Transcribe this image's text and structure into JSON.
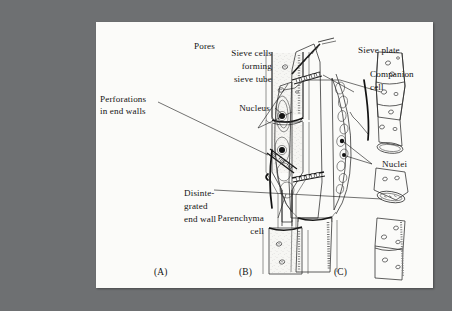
{
  "figure": {
    "background_color": "#6e7072",
    "plate_color": "#fbfbf9",
    "ink_color": "#121212"
  },
  "labels": {
    "pores": "Pores",
    "perforations": "Perforations\nin end walls",
    "perforations_line1": "Perforations",
    "perforations_line2": "in end walls",
    "disintegrated_line1": "Disinte-",
    "disintegrated_line2": "grated",
    "disintegrated_line3": "end wall",
    "sieve_cells_line1": "Sieve cells",
    "sieve_cells_line2": "forming",
    "sieve_cells_line3": "sieve tube",
    "sieve_plate": "Sieve plate",
    "companion_line1": "Companion",
    "companion_line2": "cell",
    "nucleus": "Nucleus",
    "nuclei": "Nuclei",
    "parenchyma_line1": "Parenchyma",
    "parenchyma_line2": "cell"
  },
  "captions": {
    "a": "(A)",
    "b": "(B)",
    "c": "(C)"
  },
  "panels": [
    {
      "id": "A",
      "caption": "(A)",
      "description": "Vessel element with perforated end walls",
      "annotations": [
        "Pores",
        "Perforations in end walls"
      ]
    },
    {
      "id": "B",
      "caption": "(B)",
      "description": "Separated vessel segments showing disintegrated end wall",
      "annotations": [
        "Pores",
        "Disintegrated end wall"
      ]
    },
    {
      "id": "C",
      "caption": "(C)",
      "description": "Sieve tube with sieve plates, companion cells and parenchyma",
      "annotations": [
        "Sieve cells forming sieve tube",
        "Sieve plate",
        "Companion cell",
        "Nucleus",
        "Nuclei",
        "Parenchyma cell"
      ]
    }
  ]
}
